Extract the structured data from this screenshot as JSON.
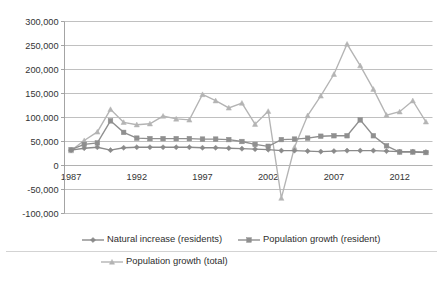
{
  "chart_data": {
    "type": "line",
    "title": "",
    "subtitle": "",
    "xlabel": "",
    "ylabel": "",
    "x": [
      1987,
      1988,
      1989,
      1990,
      1991,
      1992,
      1993,
      1994,
      1995,
      1996,
      1997,
      1998,
      1999,
      2000,
      2001,
      2002,
      2003,
      2004,
      2005,
      2006,
      2007,
      2008,
      2009,
      2010,
      2011,
      2012,
      2013,
      2014
    ],
    "xlim": [
      1986.5,
      2014.5
    ],
    "ylim": [
      -100000,
      300000
    ],
    "yticks": [
      -100000,
      -50000,
      0,
      50000,
      100000,
      150000,
      200000,
      250000,
      300000
    ],
    "ytick_labels": [
      "-100,000",
      "-50,000",
      "0",
      "50,000",
      "100,000",
      "150,000",
      "200,000",
      "250,000",
      "300,000"
    ],
    "xticks": [
      1987,
      1992,
      1997,
      2002,
      2007,
      2012
    ],
    "xtick_labels": [
      "1987",
      "1992",
      "1997",
      "2002",
      "2007",
      "2012"
    ],
    "grid": true,
    "grid_axis": "y",
    "legend_position": "bottom",
    "series": [
      {
        "name": "Natural increase (residents)",
        "marker": "diamond",
        "color": "#8a8a8a",
        "values": [
          32000,
          36000,
          38000,
          32000,
          37000,
          38000,
          38000,
          38000,
          38000,
          38000,
          37000,
          37000,
          36000,
          35000,
          34000,
          33000,
          31000,
          31000,
          30000,
          29000,
          30000,
          31000,
          31000,
          31000,
          30000,
          29000,
          29000,
          28000
        ]
      },
      {
        "name": "Population growth (resident)",
        "marker": "square",
        "color": "#8f8f8f",
        "values": [
          33000,
          44000,
          47000,
          93000,
          69000,
          57000,
          56000,
          56000,
          56000,
          56000,
          55000,
          55000,
          54000,
          50000,
          44000,
          40000,
          54000,
          55000,
          57000,
          61000,
          62000,
          62000,
          95000,
          62000,
          41000,
          28000,
          28000,
          27000
        ]
      },
      {
        "name": "Population growth (total)",
        "marker": "triangle",
        "color": "#b4b4b4",
        "values": [
          31000,
          52000,
          70000,
          117000,
          90000,
          85000,
          87000,
          103000,
          97000,
          95000,
          148000,
          135000,
          120000,
          130000,
          86000,
          113000,
          -68000,
          38000,
          104000,
          145000,
          190000,
          253000,
          208000,
          159000,
          105000,
          112000,
          135000,
          91000
        ]
      }
    ]
  },
  "legend": {
    "items": [
      {
        "label": "Natural increase (residents)"
      },
      {
        "label": "Population growth (resident)"
      },
      {
        "label": "Population growth (total)"
      }
    ]
  }
}
